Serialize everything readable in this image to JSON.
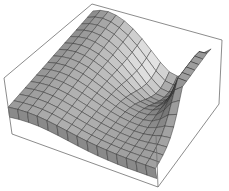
{
  "chart_data": {
    "type": "surface3d",
    "title": "",
    "xlabel": "",
    "ylabel": "",
    "zlabel": "",
    "axes_ticks": false,
    "bounding_box": true,
    "mesh_lines": true,
    "grid_resolution": 15,
    "box_corners_px": {
      "top_back_left": [
        92,
        4
      ],
      "top_back_right": [
        222,
        40
      ],
      "top_front_left": [
        4,
        78
      ],
      "top_front_right": [
        156,
        135
      ],
      "bottom_back_right": [
        219,
        104
      ],
      "bottom_front_left": [
        12,
        134
      ],
      "bottom_front_right": [
        158,
        187
      ]
    }
  },
  "colors": {
    "background": "#ffffff",
    "box_line": "#6e6e6e",
    "mesh_line": "#2a2a2a",
    "light_face": "#e6e6e6",
    "dark_face": "#1c1c1c"
  }
}
